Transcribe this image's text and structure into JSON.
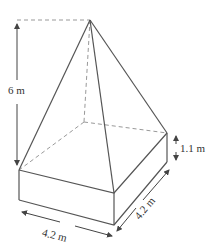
{
  "figure": {
    "type": "pyramid-on-cuboid",
    "labels": {
      "total_height": "6 m",
      "box_height": "1.1 m",
      "front_width": "4.2 m",
      "side_depth": "4.2 m"
    },
    "colors": {
      "solid_line": "#555555",
      "dashed_line": "#999999",
      "text": "#333333"
    }
  }
}
